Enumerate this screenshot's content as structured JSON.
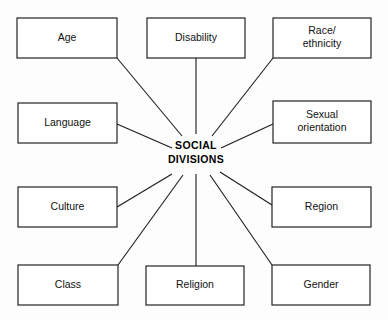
{
  "diagram": {
    "hub": {
      "name": "social-divisions-hub",
      "line1": "SOCIAL",
      "line2": "DIVISIONS",
      "cx": 196,
      "cy": 153,
      "line1_y": 146,
      "line2_y": 160
    },
    "style": {
      "background": "#fdfdfd",
      "box_fill": "#ffffff",
      "stroke": "#1b1b1b",
      "text_color": "#111111"
    },
    "nodes": [
      {
        "name": "node-age",
        "label": "Age",
        "lines": [
          "Age"
        ],
        "x": 17,
        "y": 18,
        "w": 100,
        "h": 40,
        "anchor_x": 117,
        "anchor_y": 58,
        "spoke_end_x": 182,
        "spoke_end_y": 136
      },
      {
        "name": "node-disability",
        "label": "Disability",
        "lines": [
          "Disability"
        ],
        "x": 147,
        "y": 18,
        "w": 98,
        "h": 40,
        "anchor_x": 196,
        "anchor_y": 58,
        "spoke_end_x": 196,
        "spoke_end_y": 134
      },
      {
        "name": "node-race-ethnicity",
        "label": "Race/ ethnicity",
        "lines": [
          "Race/",
          "ethnicity"
        ],
        "x": 273,
        "y": 18,
        "w": 98,
        "h": 40,
        "anchor_x": 273,
        "anchor_y": 58,
        "spoke_end_x": 212,
        "spoke_end_y": 136
      },
      {
        "name": "node-language",
        "label": "Language",
        "lines": [
          "Language"
        ],
        "x": 18,
        "y": 103,
        "w": 99,
        "h": 40,
        "anchor_x": 117,
        "anchor_y": 124,
        "spoke_end_x": 172,
        "spoke_end_y": 148
      },
      {
        "name": "node-sexual-orientation",
        "label": "Sexual orientation",
        "lines": [
          "Sexual",
          "orientation"
        ],
        "x": 273,
        "y": 101,
        "w": 98,
        "h": 42,
        "anchor_x": 273,
        "anchor_y": 124,
        "spoke_end_x": 221,
        "spoke_end_y": 148
      },
      {
        "name": "node-culture",
        "label": "Culture",
        "lines": [
          "Culture"
        ],
        "x": 18,
        "y": 187,
        "w": 99,
        "h": 40,
        "anchor_x": 117,
        "anchor_y": 207,
        "spoke_end_x": 172,
        "spoke_end_y": 174
      },
      {
        "name": "node-region",
        "label": "Region",
        "lines": [
          "Region"
        ],
        "x": 272,
        "y": 187,
        "w": 99,
        "h": 40,
        "anchor_x": 272,
        "anchor_y": 205,
        "spoke_end_x": 220,
        "spoke_end_y": 172
      },
      {
        "name": "node-class",
        "label": "Class",
        "lines": [
          "Class"
        ],
        "x": 18,
        "y": 265,
        "w": 100,
        "h": 40,
        "anchor_x": 118,
        "anchor_y": 265,
        "spoke_end_x": 183,
        "spoke_end_y": 175
      },
      {
        "name": "node-religion",
        "label": "Religion",
        "lines": [
          "Religion"
        ],
        "x": 146,
        "y": 266,
        "w": 98,
        "h": 39,
        "anchor_x": 196,
        "anchor_y": 266,
        "spoke_end_x": 196,
        "spoke_end_y": 174
      },
      {
        "name": "node-gender",
        "label": "Gender",
        "lines": [
          "Gender"
        ],
        "x": 272,
        "y": 265,
        "w": 98,
        "h": 40,
        "anchor_x": 272,
        "anchor_y": 265,
        "spoke_end_x": 210,
        "spoke_end_y": 175
      }
    ]
  }
}
